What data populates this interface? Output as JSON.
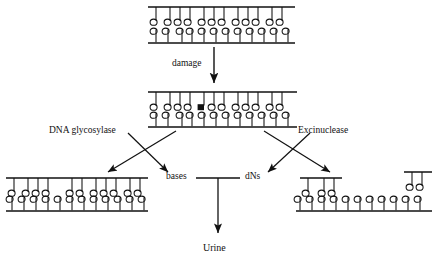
{
  "diagram": {
    "type": "flow-diagram",
    "ink_color": "#111111",
    "background_color": "#ffffff"
  },
  "labels": {
    "damage": "damage",
    "dna_glycosylase": "DNA glycosylase",
    "excinuclease": "Excinuclease",
    "bases": "bases",
    "dns": "dNs",
    "urine": "Urine"
  },
  "nodes": [
    {
      "id": "intact-dna",
      "name": "intact-duplex-dna",
      "position": "top-center",
      "top_strand_nucleotides": 11,
      "bottom_strand_nucleotides": 12,
      "damaged_base_index": null,
      "top_strand_gap": false,
      "detached_fragment": false
    },
    {
      "id": "damaged-dna",
      "name": "damaged-duplex-dna",
      "position": "middle-center",
      "top_strand_nucleotides": 11,
      "bottom_strand_nucleotides": 12,
      "damaged_base_index": 4,
      "top_strand_gap": false,
      "detached_fragment": false
    },
    {
      "id": "ap-site-dna",
      "name": "base-excised-dna",
      "position": "bottom-left",
      "top_strand_nucleotides": 10,
      "bottom_strand_nucleotides": 12,
      "damaged_base_index": null,
      "top_strand_gap": true,
      "detached_fragment": false
    },
    {
      "id": "gapped-dna",
      "name": "oligonucleotide-excised-dna",
      "position": "bottom-right",
      "top_strand_nucleotides": 3,
      "bottom_strand_nucleotides": 11,
      "damaged_base_index": null,
      "top_strand_gap": true,
      "detached_fragment": true,
      "detached_fragment_nucleotides": 2
    }
  ],
  "arrows": [
    {
      "name": "damage-arrow",
      "from": "intact-dna",
      "to": "damaged-dna",
      "label": "damage"
    },
    {
      "name": "glycosylase-arrow-to-dna",
      "from": "damaged-dna",
      "to": "ap-site-dna",
      "label": "DNA glycosylase"
    },
    {
      "name": "glycosylase-arrow-to-bases",
      "from": "damaged-dna",
      "to": "bases",
      "label": "DNA glycosylase"
    },
    {
      "name": "excinuclease-arrow-to-dns",
      "from": "damaged-dna",
      "to": "dNs",
      "label": "Excinuclease"
    },
    {
      "name": "excinuclease-arrow-to-dna",
      "from": "damaged-dna",
      "to": "gapped-dna",
      "label": "Excinuclease"
    },
    {
      "name": "urine-arrow",
      "from": "bases-and-dNs-junction",
      "to": "urine",
      "label": "Urine"
    }
  ]
}
